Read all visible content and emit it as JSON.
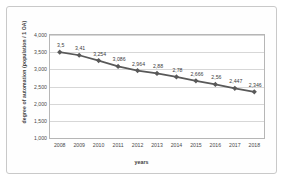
{
  "chart_data": {
    "type": "line",
    "title": "",
    "subtitle": "",
    "xlabel": "years",
    "ylabel": "degree of automation (population / 1 OA)",
    "categories": [
      "2008",
      "2009",
      "2010",
      "2011",
      "2012",
      "2013",
      "2014",
      "2015",
      "2016",
      "2017",
      "2018"
    ],
    "values": [
      3.5,
      3.41,
      3.254,
      3.086,
      2.964,
      2.88,
      2.78,
      2.666,
      2.56,
      2.447,
      2.346
    ],
    "point_labels": [
      "3,5",
      "3,41",
      "3,254",
      "3,086",
      "2,964",
      "2,88",
      "2,78",
      "2,666",
      "2,56",
      "2,447",
      "2,346"
    ],
    "ylim": [
      1.0,
      4.0
    ],
    "ytick_values": [
      1.0,
      1.5,
      2.0,
      2.5,
      3.0,
      3.5,
      4.0
    ],
    "ytick_labels": [
      "1,000",
      "1,500",
      "2,000",
      "2,500",
      "3,000",
      "3,500",
      "4,000"
    ],
    "grid": true,
    "legend": false,
    "legend_position": "none",
    "series_color": "#595959",
    "marker": "diamond",
    "gridline_color": "#d7d7d7",
    "axis_color": "#b6b6b6"
  }
}
